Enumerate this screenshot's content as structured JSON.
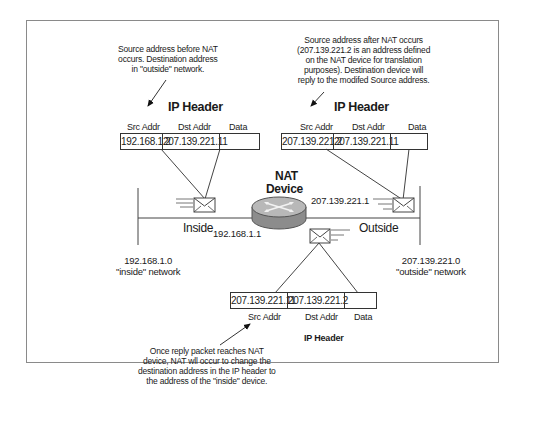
{
  "diagram": {
    "notes": {
      "before_nat": [
        "Source address before NAT",
        "occurs.  Destination address",
        "in \"outside\" network."
      ],
      "after_nat": [
        "Source address after NAT occurs",
        "(207.139.221.2 is an address defined",
        "on the NAT device for translation",
        "purposes). Destination device will",
        "reply to the modifed Source address."
      ],
      "reply": [
        "Once reply packet reaches NAT",
        "device, NAT wll occur to change the",
        "destination address in the IP header to",
        "the address of the \"inside\" device."
      ]
    },
    "headers": {
      "left": {
        "title": "IP Header",
        "columns": [
          "Src Addr",
          "Dst Addr",
          "Data"
        ],
        "values": [
          "192.168.1.2",
          "207.139.221.11",
          ""
        ]
      },
      "right": {
        "title": "IP Header",
        "columns": [
          "Src Addr",
          "Dst Addr",
          "Data"
        ],
        "values": [
          "207.139.221.2",
          "207.139.221.11",
          ""
        ]
      },
      "bottom": {
        "title": "IP Header",
        "columns": [
          "Src Addr",
          "Dst Addr",
          "Data"
        ],
        "values": [
          "207.139.221.11",
          "207.139.221.2",
          ""
        ]
      }
    },
    "nat_device": {
      "label_line1": "NAT",
      "label_line2": "Device",
      "inside_ip": "192.168.1.1",
      "outside_ip": "207.139.221.1"
    },
    "segments": {
      "inside_label": "Inside",
      "outside_label": "Outside"
    },
    "networks": {
      "inside": {
        "address": "192.168.1.0",
        "name": "\"inside\" network"
      },
      "outside": {
        "address": "207.139.221.0",
        "name": "\"outside\" network"
      }
    },
    "colors": {
      "line": "#333333",
      "frame": "#8a8a8a",
      "router_top": "#b8b8b8",
      "router_side": "#8c8c8c"
    }
  }
}
